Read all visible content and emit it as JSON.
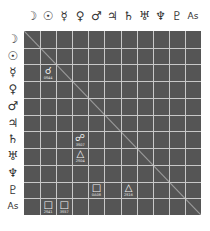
{
  "colors": {
    "grid_bg": "#555555",
    "grid_lines": "#c8c8c8",
    "aspect_fg": "#f2f2f2",
    "label": "#333333"
  },
  "bodies": [
    {
      "key": "moon",
      "glyph": "☽"
    },
    {
      "key": "sun",
      "glyph": "☉"
    },
    {
      "key": "mercury",
      "glyph": "☿"
    },
    {
      "key": "venus",
      "glyph": "♀"
    },
    {
      "key": "mars",
      "glyph": "♂"
    },
    {
      "key": "jupiter",
      "glyph": "♃"
    },
    {
      "key": "saturn",
      "glyph": "♄"
    },
    {
      "key": "uranus",
      "glyph": "♅"
    },
    {
      "key": "neptune",
      "glyph": "♆"
    },
    {
      "key": "pluto",
      "glyph": "♇"
    },
    {
      "key": "ascendant",
      "glyph": "As"
    }
  ],
  "aspects": [
    {
      "row": 2,
      "col": 1,
      "type": "conjunction",
      "glyph": "☌",
      "orb": "0S44"
    },
    {
      "row": 6,
      "col": 3,
      "type": "opposition",
      "glyph": "☍",
      "orb": "3S07"
    },
    {
      "row": 7,
      "col": 3,
      "type": "trine",
      "glyph": "△",
      "orb": "2S04"
    },
    {
      "row": 9,
      "col": 4,
      "type": "square",
      "glyph": "□",
      "orb": "0A08"
    },
    {
      "row": 9,
      "col": 6,
      "type": "trine",
      "glyph": "△",
      "orb": "2S16"
    },
    {
      "row": 10,
      "col": 1,
      "type": "square",
      "glyph": "□",
      "orb": "2S41"
    },
    {
      "row": 10,
      "col": 2,
      "type": "square",
      "glyph": "□",
      "orb": "3S57"
    }
  ]
}
